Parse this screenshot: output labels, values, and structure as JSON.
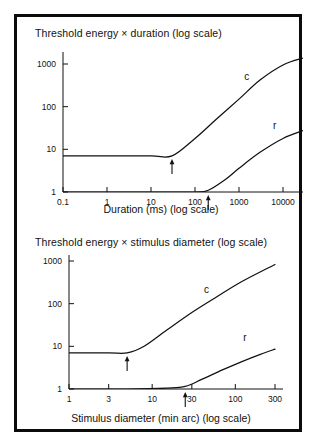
{
  "figure": {
    "border_color": "#0b0b0b",
    "background_color": "#ffffff",
    "ink_color": "#111111"
  },
  "chart_data": [
    {
      "type": "line",
      "panel": "top",
      "title": "Threshold energy × duration (log scale)",
      "xlabel": "Duration (ms) (log scale)",
      "ylabel": "",
      "xscale": "log",
      "yscale": "log",
      "xlim": [
        0.1,
        10000
      ],
      "ylim": [
        1,
        1000
      ],
      "xticks": [
        "0.1",
        "1",
        "10",
        "100",
        "1000",
        "10000"
      ],
      "xtick_values": [
        0.1,
        1,
        10,
        100,
        1000,
        10000
      ],
      "yticks": [
        "1",
        "10",
        "100",
        "1000"
      ],
      "ytick_values": [
        1,
        10,
        100,
        1000
      ],
      "grid": false,
      "legend": "inline-curve-labels",
      "series": [
        {
          "name": "c",
          "label": "c",
          "description": "cone curve",
          "x": [
            0.1,
            1,
            10,
            30,
            100,
            300,
            1000,
            3000,
            10000,
            30000
          ],
          "y": [
            7,
            7,
            7,
            7,
            18,
            50,
            150,
            420,
            950,
            1400
          ]
        },
        {
          "name": "r",
          "label": "r",
          "description": "rod curve",
          "x": [
            0.1,
            1,
            10,
            100,
            200,
            500,
            1000,
            3000,
            10000,
            30000
          ],
          "y": [
            1,
            1,
            1,
            1,
            1.1,
            2.0,
            3.6,
            8.5,
            18,
            28
          ]
        }
      ],
      "annotations": [
        {
          "name": "critical-duration-cone",
          "symbol": "arrow-up",
          "x": 30,
          "y": 7,
          "series": "c"
        },
        {
          "name": "critical-duration-rod",
          "symbol": "arrow-up",
          "x": 200,
          "y": 1,
          "series": "r"
        }
      ]
    },
    {
      "type": "line",
      "panel": "bottom",
      "title": "Threshold energy × stimulus diameter (log scale)",
      "xlabel": "Stimulus diameter (min arc) (log scale)",
      "ylabel": "",
      "xscale": "log",
      "yscale": "log",
      "xlim": [
        1,
        300
      ],
      "ylim": [
        1,
        1000
      ],
      "xticks": [
        "1",
        "3",
        "10",
        "30",
        "100",
        "300"
      ],
      "xtick_values": [
        1,
        3,
        10,
        30,
        100,
        300
      ],
      "yticks": [
        "1",
        "10",
        "100",
        "1000"
      ],
      "ytick_values": [
        1,
        10,
        100,
        1000
      ],
      "grid": false,
      "legend": "inline-curve-labels",
      "series": [
        {
          "name": "c",
          "label": "c",
          "description": "cone curve",
          "x": [
            1,
            3,
            5,
            8,
            15,
            30,
            60,
            120,
            300
          ],
          "y": [
            7,
            7,
            7,
            10,
            24,
            62,
            145,
            330,
            830
          ]
        },
        {
          "name": "r",
          "label": "r",
          "description": "rod curve",
          "x": [
            1,
            5,
            15,
            25,
            40,
            70,
            120,
            200,
            300
          ],
          "y": [
            1,
            1,
            1.05,
            1.15,
            1.7,
            2.8,
            4.4,
            6.5,
            8.6
          ]
        }
      ],
      "annotations": [
        {
          "name": "critical-diameter-cone",
          "symbol": "arrow-up",
          "x": 5,
          "y": 7,
          "series": "c"
        },
        {
          "name": "critical-diameter-rod",
          "symbol": "arrow-up",
          "x": 25,
          "y": 1,
          "series": "r"
        }
      ]
    }
  ]
}
